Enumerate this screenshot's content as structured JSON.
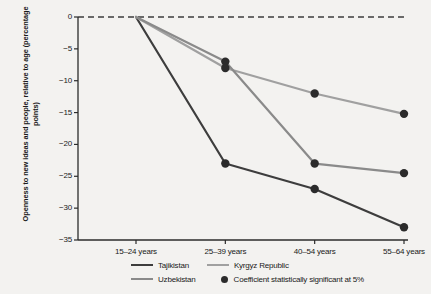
{
  "chart_data": {
    "type": "line",
    "title": "",
    "subtitle": "",
    "xlabel": "",
    "ylabel": "Openness to new ideas and people, relative to age (percentage points)",
    "categories": [
      "15–24 years",
      "25–39 years",
      "40–54 years",
      "55–64 years"
    ],
    "ylim": [
      -35,
      0
    ],
    "yticks": [
      "0",
      "−5",
      "−10",
      "−15",
      "−20",
      "−25",
      "−30",
      "−35"
    ],
    "ytick_values": [
      0,
      -5,
      -10,
      -15,
      -20,
      -25,
      -30,
      -35
    ],
    "grid": false,
    "zero_reference_line": true,
    "legend_position": "bottom",
    "series": [
      {
        "name": "Tajikistan",
        "color": "#3d3d3d",
        "values": [
          0,
          -23,
          -27,
          -33
        ],
        "significant": [
          false,
          true,
          true,
          true
        ]
      },
      {
        "name": "Kyrgyz Republic",
        "color": "#a0a0a0",
        "values": [
          0,
          -8,
          -12,
          -15.2
        ],
        "significant": [
          false,
          true,
          true,
          true
        ]
      },
      {
        "name": "Uzbekistan",
        "color": "#8a8a8a",
        "values": [
          0,
          -7,
          -23,
          -24.5
        ],
        "significant": [
          false,
          true,
          true,
          true
        ]
      }
    ],
    "marker_note": "Coefficient statistically significant at 5%",
    "marker_color": "#2b2b2b"
  },
  "legend": {
    "items": [
      {
        "label": "Tajikistan",
        "color": "#3d3d3d",
        "type": "line"
      },
      {
        "label": "Kyrgyz Republic",
        "color": "#a0a0a0",
        "type": "line"
      },
      {
        "label": "Uzbekistan",
        "color": "#8a8a8a",
        "type": "line"
      },
      {
        "label": "Coefficient statistically significant at 5%",
        "color": "#2b2b2b",
        "type": "dot"
      }
    ]
  }
}
